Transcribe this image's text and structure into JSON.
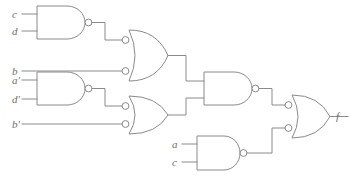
{
  "diagram": {
    "type": "combinational-logic-circuit",
    "background_color": "#ffffff",
    "stroke_color": "#8a8a8a",
    "label_color": "#6e6e6e"
  },
  "inputs": [
    {
      "id": "in-c-top",
      "label": "c",
      "base": "c",
      "prime": "",
      "x": 12,
      "y": 18,
      "wire_y": 14,
      "wire_x_end": 37
    },
    {
      "id": "in-d-top",
      "label": "d",
      "base": "d",
      "prime": "",
      "x": 12,
      "y": 35,
      "wire_y": 31,
      "wire_x_end": 37
    },
    {
      "id": "in-b",
      "label": "b",
      "base": "b",
      "prime": "",
      "x": 12,
      "y": 62,
      "wire_y": 58,
      "wire_x_end": 122
    },
    {
      "id": "in-a-prime",
      "label": "a'",
      "base": "a",
      "prime": "'",
      "x": 12,
      "y": 84,
      "wire_y": 80,
      "wire_x_end": 37
    },
    {
      "id": "in-d-prime",
      "label": "d'",
      "base": "d",
      "prime": "'",
      "x": 12,
      "y": 103,
      "wire_y": 99,
      "wire_x_end": 37
    },
    {
      "id": "in-b-prime",
      "label": "b'",
      "base": "b",
      "prime": "'",
      "x": 12,
      "y": 128,
      "wire_y": 124,
      "wire_x_end": 122
    },
    {
      "id": "in-a-bot",
      "label": "a",
      "base": "a",
      "prime": "",
      "x": 172,
      "y": 148,
      "wire_y": 144,
      "wire_x_end": 197
    },
    {
      "id": "in-c-bot",
      "label": "c",
      "base": "c",
      "prime": "",
      "x": 172,
      "y": 166,
      "wire_y": 162,
      "wire_x_end": 197
    }
  ],
  "gates": [
    {
      "id": "gate-nand-1",
      "name": "nand-gate-cd",
      "kind": "NAND",
      "inputs": [
        "c",
        "d"
      ],
      "output_signal": "(cd)'"
    },
    {
      "id": "gate-nand-2",
      "name": "nand-gate-apdp",
      "kind": "NAND",
      "inputs": [
        "a'",
        "d'"
      ],
      "output_signal": "(a'd')'"
    },
    {
      "id": "gate-or-1",
      "name": "or-gate-inverted-inputs-top",
      "kind": "OR-INVERTED-INPUTS",
      "inputs": [
        "(cd)'",
        "b"
      ],
      "output_signal": "cd + b'"
    },
    {
      "id": "gate-or-2",
      "name": "or-gate-inverted-inputs-bottom",
      "kind": "OR-INVERTED-INPUTS",
      "inputs": [
        "(a'd')'",
        "b'"
      ],
      "output_signal": "a'd' + b"
    },
    {
      "id": "gate-nand-3",
      "name": "nand-gate-middle",
      "kind": "NAND",
      "inputs": [
        "or-1-out",
        "or-2-out"
      ],
      "output_signal": "middle"
    },
    {
      "id": "gate-nand-4",
      "name": "nand-gate-ac",
      "kind": "NAND",
      "inputs": [
        "a",
        "c"
      ],
      "output_signal": "(ac)'"
    },
    {
      "id": "gate-or-3",
      "name": "or-gate-inverted-inputs-output",
      "kind": "OR-INVERTED-INPUTS",
      "inputs": [
        "middle",
        "(ac)'"
      ],
      "output_signal": "f"
    }
  ],
  "output": {
    "id": "out-f",
    "label": "f",
    "x": 336,
    "y": 120
  }
}
